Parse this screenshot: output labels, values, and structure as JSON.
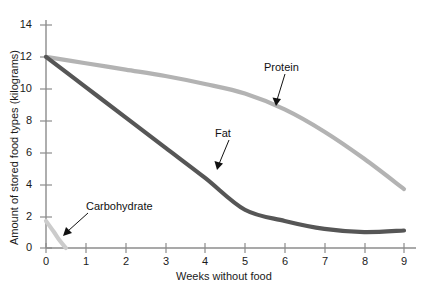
{
  "chart_data": {
    "type": "line",
    "title": "",
    "xlabel": "Weeks without food",
    "ylabel": "Amount of stored food types (kilograms)",
    "xlim": [
      0,
      9
    ],
    "ylim": [
      0,
      14
    ],
    "grid": false,
    "legend": "inline-annotations",
    "x_ticks": [
      "0",
      "1",
      "2",
      "3",
      "4",
      "5",
      "6",
      "7",
      "8",
      "9"
    ],
    "y_ticks": [
      "0",
      "2",
      "4",
      "6",
      "8",
      "10",
      "12",
      "14"
    ],
    "series": [
      {
        "name": "Protein",
        "color": "#b3b3b3",
        "x": [
          0,
          1,
          2,
          3,
          4,
          5,
          6,
          7,
          8,
          9
        ],
        "values": [
          12.0,
          11.6,
          11.2,
          10.8,
          10.3,
          9.7,
          8.7,
          7.3,
          5.6,
          3.7
        ]
      },
      {
        "name": "Fat",
        "color": "#565656",
        "x": [
          0,
          1,
          2,
          3,
          4,
          5,
          6,
          7,
          8,
          9
        ],
        "values": [
          12.0,
          10.1,
          8.2,
          6.3,
          4.4,
          2.4,
          1.7,
          1.2,
          1.0,
          1.1
        ]
      },
      {
        "name": "Carbohydrate",
        "color": "#cccccc",
        "x": [
          0,
          0.2,
          0.35,
          0.5
        ],
        "values": [
          1.7,
          1.0,
          0.45,
          0.0
        ]
      }
    ],
    "annotations": [
      {
        "label": "Protein",
        "target_series": "Protein"
      },
      {
        "label": "Fat",
        "target_series": "Fat"
      },
      {
        "label": "Carbohydrate",
        "target_series": "Carbohydrate"
      }
    ]
  },
  "axes": {
    "y_title": "Amount of stored food types (kilograms)",
    "x_title": "Weeks without food",
    "axis_color": "#8c8c8c",
    "y_ticks": [
      {
        "label": "14"
      },
      {
        "label": "12"
      },
      {
        "label": "10"
      },
      {
        "label": "8"
      },
      {
        "label": "6"
      },
      {
        "label": "4"
      },
      {
        "label": "2"
      },
      {
        "label": "0"
      }
    ],
    "x_ticks": [
      {
        "label": "0"
      },
      {
        "label": "1"
      },
      {
        "label": "2"
      },
      {
        "label": "3"
      },
      {
        "label": "4"
      },
      {
        "label": "5"
      },
      {
        "label": "6"
      },
      {
        "label": "7"
      },
      {
        "label": "8"
      },
      {
        "label": "9"
      }
    ]
  },
  "annotations": {
    "protein": "Protein",
    "fat": "Fat",
    "carbohydrate": "Carbohydrate"
  }
}
